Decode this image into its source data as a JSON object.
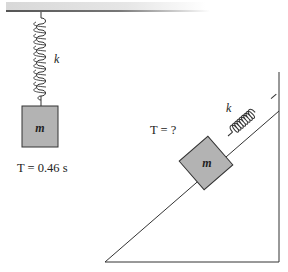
{
  "diagram": {
    "hanging_system": {
      "spring_label": "k",
      "mass_label": "m",
      "period_label": "T = 0.46 s"
    },
    "incline_system": {
      "spring_label": "k",
      "mass_label": "m",
      "period_label": "T = ?"
    },
    "colors": {
      "block_fill": "#b3b3b3",
      "line": "#333333",
      "ceiling": "#9a9a9a"
    }
  }
}
